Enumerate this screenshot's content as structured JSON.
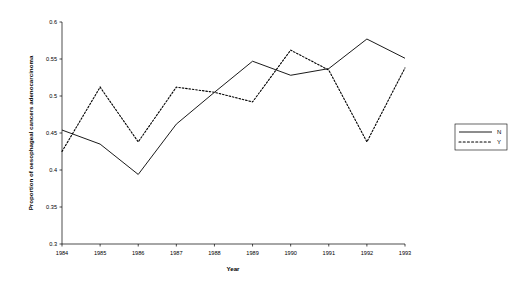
{
  "chart_data": {
    "type": "line",
    "title": "",
    "subtitle": "",
    "xlabel": "Year",
    "ylabel": "Proportion of oesophageal cancers adenocarcinoma",
    "categories": [
      "1984",
      "1985",
      "1986",
      "1987",
      "1988",
      "1989",
      "1990",
      "1991",
      "1992",
      "1993"
    ],
    "x": [
      1984,
      1985,
      1986,
      1987,
      1988,
      1989,
      1990,
      1991,
      1992,
      1993
    ],
    "xlim": [
      1984,
      1993
    ],
    "ylim": [
      0.3,
      0.6
    ],
    "yticks": [
      0.3,
      0.35,
      0.4,
      0.45,
      0.5,
      0.55,
      0.6
    ],
    "ytick_labels": [
      "0.3",
      "0.35",
      "0.4",
      "0.45",
      "0.5",
      "0.55",
      "0.6"
    ],
    "xticks": [
      1984,
      1985,
      1986,
      1987,
      1988,
      1989,
      1990,
      1991,
      1992,
      1993
    ],
    "xtick_labels": [
      "1984",
      "1985",
      "1986",
      "1987",
      "1988",
      "1989",
      "1990",
      "1991",
      "1992",
      "1993"
    ],
    "grid": false,
    "legend_position": "right",
    "series": [
      {
        "name": "N",
        "style": "solid",
        "color": "#000000",
        "values": [
          0.454,
          0.435,
          0.394,
          0.462,
          0.505,
          0.547,
          0.528,
          0.537,
          0.577,
          0.551
        ]
      },
      {
        "name": "Y",
        "style": "dashed",
        "color": "#000000",
        "values": [
          0.425,
          0.512,
          0.438,
          0.512,
          0.505,
          0.492,
          0.562,
          0.535,
          0.438,
          0.538
        ]
      }
    ]
  },
  "legend": {
    "entries": [
      {
        "label": "N"
      },
      {
        "label": "Y"
      }
    ]
  },
  "axes": {
    "x_title": "Year",
    "y_title": "Proportion of oesophageal cancers adenocarcinoma"
  }
}
